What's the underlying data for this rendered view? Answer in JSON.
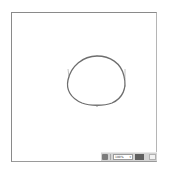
{
  "canvas": {
    "shape": {
      "type": "closed-bezier-path",
      "stroke": "#6e6e6e",
      "stroke_width": 1.3
    },
    "handles": {
      "color": "#9a9a9a"
    }
  },
  "status_bar": {
    "left_icon": "page-icon",
    "zoom_value": "100%",
    "zoom_chevron": "▾",
    "mode_button_label": "",
    "right_icon": "view-icon"
  }
}
